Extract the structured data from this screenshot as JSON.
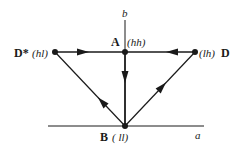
{
  "axes": {
    "vertical_label": "b",
    "horizontal_label": "a"
  },
  "nodes": {
    "A": {
      "name": "A",
      "state": "(hh)"
    },
    "B": {
      "name": "B",
      "state": "( ll)"
    },
    "D": {
      "name": "D",
      "state": "(lh)"
    },
    "Dstar": {
      "name": "D*",
      "state": "(hl)"
    }
  },
  "edges": [
    {
      "from": "D*",
      "to": "A"
    },
    {
      "from": "D",
      "to": "A"
    },
    {
      "from": "A",
      "to": "B"
    },
    {
      "from": "B",
      "to": "D*"
    },
    {
      "from": "B",
      "to": "D"
    }
  ],
  "colors": {
    "ink": "#1a1a1a"
  }
}
